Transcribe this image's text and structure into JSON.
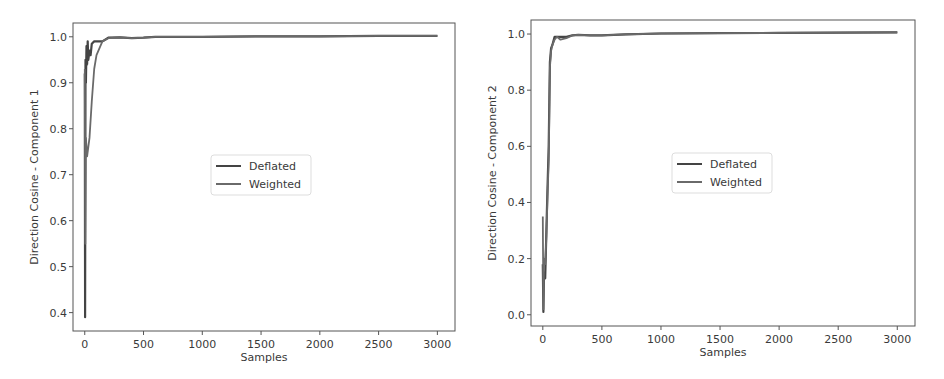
{
  "chart_data": [
    {
      "type": "line",
      "title": "",
      "xlabel": "Samples",
      "ylabel": "Direction Cosine - Component 1",
      "xlim": [
        -100,
        3150
      ],
      "ylim": [
        0.36,
        1.03
      ],
      "xticks": [
        0,
        500,
        1000,
        1500,
        2000,
        2500,
        3000
      ],
      "xtick_labels": [
        "0",
        "500",
        "1000",
        "1500",
        "2000",
        "2500",
        "3000"
      ],
      "yticks": [
        0.4,
        0.5,
        0.6,
        0.7,
        0.8,
        0.9,
        1.0
      ],
      "ytick_labels": [
        "0.4",
        "0.5",
        "0.6",
        "0.7",
        "0.8",
        "0.9",
        "1.0"
      ],
      "grid": false,
      "legend_position": "center",
      "series": [
        {
          "name": "Deflated",
          "color": "#444444",
          "x": [
            0,
            3,
            6,
            10,
            15,
            20,
            25,
            30,
            40,
            50,
            60,
            80,
            100,
            150,
            200,
            300,
            400,
            500,
            600,
            800,
            1000,
            1500,
            2000,
            2500,
            3000
          ],
          "y": [
            0.92,
            0.39,
            0.95,
            0.9,
            0.98,
            0.94,
            0.99,
            0.95,
            0.97,
            0.96,
            0.985,
            0.99,
            0.99,
            0.99,
            0.998,
            0.999,
            0.997,
            0.998,
            1.0,
            1.0,
            1.0,
            1.001,
            1.001,
            1.002,
            1.002
          ]
        },
        {
          "name": "Weighted",
          "color": "#6a6a6a",
          "x": [
            0,
            5,
            10,
            20,
            30,
            40,
            60,
            80,
            100,
            150,
            200,
            300,
            400,
            500,
            600,
            800,
            1000,
            1500,
            2000,
            2500,
            3000
          ],
          "y": [
            0.93,
            0.55,
            0.78,
            0.74,
            0.76,
            0.78,
            0.86,
            0.93,
            0.96,
            0.99,
            0.997,
            0.999,
            0.997,
            0.998,
            1.0,
            1.0,
            1.0,
            1.001,
            1.001,
            1.002,
            1.002
          ]
        }
      ]
    },
    {
      "type": "line",
      "title": "",
      "xlabel": "Samples",
      "ylabel": "Direction Cosine - Component 2",
      "xlim": [
        -100,
        3150
      ],
      "ylim": [
        -0.04,
        1.05
      ],
      "xticks": [
        0,
        500,
        1000,
        1500,
        2000,
        2500,
        3000
      ],
      "xtick_labels": [
        "0",
        "500",
        "1000",
        "1500",
        "2000",
        "2500",
        "3000"
      ],
      "yticks": [
        0.0,
        0.2,
        0.4,
        0.6,
        0.8,
        1.0
      ],
      "ytick_labels": [
        "0.0",
        "0.2",
        "0.4",
        "0.6",
        "0.8",
        "1.0"
      ],
      "grid": false,
      "legend_position": "center",
      "series": [
        {
          "name": "Deflated",
          "color": "#444444",
          "x": [
            0,
            5,
            10,
            20,
            30,
            40,
            50,
            60,
            70,
            80,
            100,
            120,
            150,
            200,
            250,
            300,
            400,
            500,
            700,
            1000,
            1500,
            2000,
            2500,
            3000
          ],
          "y": [
            0.18,
            0.01,
            0.15,
            0.13,
            0.3,
            0.45,
            0.6,
            0.9,
            0.95,
            0.96,
            0.99,
            0.99,
            0.99,
            0.99,
            0.995,
            0.997,
            0.995,
            0.995,
            0.999,
            1.002,
            1.003,
            1.004,
            1.005,
            1.006
          ]
        },
        {
          "name": "Weighted",
          "color": "#6a6a6a",
          "x": [
            0,
            5,
            10,
            20,
            30,
            40,
            50,
            60,
            70,
            80,
            100,
            120,
            150,
            200,
            250,
            300,
            400,
            500,
            700,
            1000,
            1500,
            2000,
            2500,
            3000
          ],
          "y": [
            0.35,
            0.02,
            0.2,
            0.18,
            0.28,
            0.42,
            0.55,
            0.88,
            0.94,
            0.96,
            0.98,
            0.99,
            0.98,
            0.985,
            0.995,
            0.997,
            0.995,
            0.995,
            0.999,
            1.002,
            1.003,
            1.004,
            1.005,
            1.006
          ]
        }
      ]
    }
  ],
  "plots": [
    {
      "xlabel": "Samples",
      "ylabel": "Direction Cosine - Component 1",
      "legend": [
        "Deflated",
        "Weighted"
      ]
    },
    {
      "xlabel": "Samples",
      "ylabel": "Direction Cosine - Component 2",
      "legend": [
        "Deflated",
        "Weighted"
      ]
    }
  ]
}
